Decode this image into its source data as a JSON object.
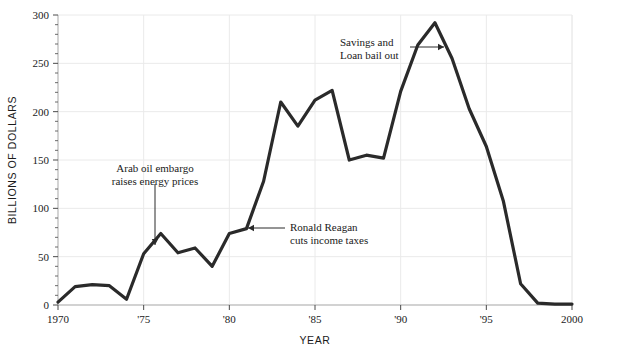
{
  "chart_data": {
    "type": "line",
    "title": "",
    "xlabel": "YEAR",
    "ylabel": "BILLIONS OF DOLLARS",
    "xlim": [
      1970,
      2000
    ],
    "ylim": [
      0,
      300
    ],
    "grid": true,
    "legend": "none",
    "x_ticks": [
      {
        "value": 1970,
        "label": "1970"
      },
      {
        "value": 1975,
        "label": "'75"
      },
      {
        "value": 1980,
        "label": "'80"
      },
      {
        "value": 1985,
        "label": "'85"
      },
      {
        "value": 1990,
        "label": "'90"
      },
      {
        "value": 1995,
        "label": "'95"
      },
      {
        "value": 2000,
        "label": "2000"
      }
    ],
    "y_ticks": [
      {
        "value": 0,
        "label": "0"
      },
      {
        "value": 50,
        "label": "50"
      },
      {
        "value": 100,
        "label": "100"
      },
      {
        "value": 150,
        "label": "150"
      },
      {
        "value": 200,
        "label": "200"
      },
      {
        "value": 250,
        "label": "250"
      },
      {
        "value": 300,
        "label": "300"
      }
    ],
    "y_minor_tick_step": 10,
    "x": [
      1970,
      1971,
      1972,
      1973,
      1974,
      1975,
      1976,
      1977,
      1978,
      1979,
      1980,
      1981,
      1982,
      1983,
      1984,
      1985,
      1986,
      1987,
      1988,
      1989,
      1990,
      1991,
      1992,
      1993,
      1994,
      1995,
      1996,
      1997,
      1998,
      1999,
      2000
    ],
    "values": [
      3,
      19,
      21,
      20,
      6,
      53,
      74,
      54,
      59,
      40,
      74,
      79,
      128,
      210,
      185,
      212,
      222,
      150,
      155,
      152,
      221,
      269,
      292,
      255,
      203,
      164,
      107,
      22,
      2,
      1,
      1
    ],
    "series": [
      {
        "name": "Federal budget deficit",
        "color": "#2a2a2a",
        "values": [
          3,
          19,
          21,
          20,
          6,
          53,
          74,
          54,
          59,
          40,
          74,
          79,
          128,
          210,
          185,
          212,
          222,
          150,
          155,
          152,
          221,
          269,
          292,
          255,
          203,
          164,
          107,
          22,
          2,
          1,
          1
        ]
      }
    ],
    "annotations": [
      {
        "id": "arab-oil-embargo",
        "lines": [
          "Arab oil embargo",
          "raises energy prices"
        ],
        "text_x": 155,
        "text_y": 172,
        "text_anchor": "middle",
        "arrow": {
          "x1": 155,
          "y1": 184,
          "x2": 155,
          "y2": 245,
          "direction": "down"
        }
      },
      {
        "id": "ronald-reagan-tax-cuts",
        "lines": [
          "Ronald Reagan",
          "cuts income taxes"
        ],
        "text_x": 290,
        "text_y": 231,
        "text_anchor": "start",
        "arrow": {
          "x1": 285,
          "y1": 228,
          "x2": 248,
          "y2": 228,
          "direction": "left"
        }
      },
      {
        "id": "savings-and-loan-bailout",
        "lines": [
          "Savings and",
          "Loan bail out"
        ],
        "text_x": 340,
        "text_y": 46,
        "text_anchor": "start",
        "arrow": {
          "x1": 410,
          "y1": 47,
          "x2": 444,
          "y2": 47,
          "direction": "right"
        }
      }
    ],
    "colors": {
      "line": "#2a2a2a",
      "grid": "#eaeaea",
      "axis": "#b0b0b0",
      "text": "#1a1a1a",
      "background": "#ffffff"
    },
    "top_strip_note": ""
  },
  "plot_geometry": {
    "left": 58,
    "right": 572,
    "top": 15,
    "bottom": 305
  }
}
